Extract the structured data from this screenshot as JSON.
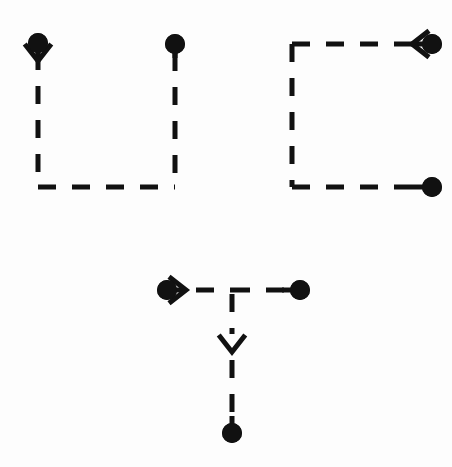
{
  "canvas": {
    "width": 452,
    "height": 467,
    "background_color": "#fdfdfd",
    "ink_color": "#111111",
    "stroke_width": 5,
    "dash_pattern": "18 16",
    "node_radius": 10,
    "arrow_size": 17
  },
  "diagram": {
    "type": "dashed-path-glyph-figure",
    "shapes": [
      {
        "id": "shape-u-left",
        "name": "left-u-bracket-path",
        "label": "U-shaped dashed path",
        "nodes": [
          {
            "id": "node-a",
            "name": "dot-top-left",
            "x": 38,
            "y": 43,
            "type": "dot"
          },
          {
            "id": "node-b",
            "name": "dot-top-mid",
            "x": 175,
            "y": 44,
            "type": "dot"
          }
        ],
        "segments": [
          {
            "id": "seg-a1",
            "name": "left-vertical-dashed",
            "x1": 38,
            "y1": 52,
            "x2": 38,
            "y2": 187
          },
          {
            "id": "seg-a2",
            "name": "bottom-horizontal-dashed",
            "x1": 38,
            "y1": 187,
            "x2": 175,
            "y2": 187
          },
          {
            "id": "seg-a3",
            "name": "right-vertical-dashed",
            "x1": 175,
            "y1": 53,
            "x2": 175,
            "y2": 187
          }
        ],
        "arrows": [
          {
            "id": "arrow-a1",
            "name": "arrowhead-down-left",
            "x": 38,
            "y": 61,
            "direction": "down"
          }
        ]
      },
      {
        "id": "shape-c-right",
        "name": "right-c-bracket-path",
        "label": "C-shaped dashed path",
        "nodes": [
          {
            "id": "node-c",
            "name": "dot-top-right",
            "x": 432,
            "y": 44,
            "type": "dot"
          },
          {
            "id": "node-d",
            "name": "dot-bottom-right",
            "x": 432,
            "y": 187,
            "type": "dot"
          }
        ],
        "segments": [
          {
            "id": "seg-b1",
            "name": "top-horizontal-dashed",
            "x1": 292,
            "y1": 44,
            "x2": 422,
            "y2": 44
          },
          {
            "id": "seg-b2",
            "name": "left-vertical-dashed",
            "x1": 292,
            "y1": 44,
            "x2": 292,
            "y2": 187
          },
          {
            "id": "seg-b3",
            "name": "bottom-horizontal-dashed",
            "x1": 292,
            "y1": 187,
            "x2": 424,
            "y2": 187
          }
        ],
        "arrows": [
          {
            "id": "arrow-b1",
            "name": "arrowhead-left-top",
            "x": 412,
            "y": 44,
            "direction": "left"
          }
        ]
      },
      {
        "id": "shape-t-bottom",
        "name": "bottom-t-junction-path",
        "label": "T-shaped dashed path",
        "nodes": [
          {
            "id": "node-e",
            "name": "dot-left-start",
            "x": 167,
            "y": 290,
            "type": "dot"
          },
          {
            "id": "node-f",
            "name": "dot-right-end",
            "x": 300,
            "y": 290,
            "type": "dot"
          },
          {
            "id": "node-g",
            "name": "dot-bottom-end",
            "x": 232,
            "y": 433,
            "type": "dot"
          }
        ],
        "segments": [
          {
            "id": "seg-c1",
            "name": "horizontal-dashed-left",
            "x1": 196,
            "y1": 290,
            "x2": 232,
            "y2": 290
          },
          {
            "id": "seg-c2",
            "name": "horizontal-dashed-right",
            "x1": 232,
            "y1": 290,
            "x2": 290,
            "y2": 290
          },
          {
            "id": "seg-c3",
            "name": "vertical-dashed-upper",
            "x1": 232,
            "y1": 294,
            "x2": 232,
            "y2": 334
          },
          {
            "id": "seg-c4",
            "name": "vertical-dashed-lower",
            "x1": 232,
            "y1": 360,
            "x2": 232,
            "y2": 425
          }
        ],
        "arrows": [
          {
            "id": "arrow-c1",
            "name": "arrowhead-right-start",
            "x": 186,
            "y": 290,
            "direction": "right"
          },
          {
            "id": "arrow-c2",
            "name": "arrowhead-down-branch",
            "x": 232,
            "y": 352,
            "direction": "down"
          }
        ]
      }
    ]
  }
}
